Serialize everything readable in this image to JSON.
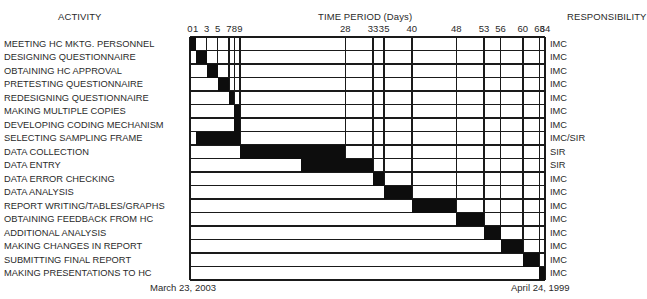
{
  "chart_data": {
    "type": "gantt",
    "title": "TIME PERIOD (Days)",
    "column_headers": {
      "activity": "ACTIVITY",
      "time": "TIME PERIOD (Days)",
      "responsibility": "RESPONSIBILITY"
    },
    "x_ticks": [
      0,
      1,
      3,
      5,
      7,
      8,
      9,
      28,
      33,
      35,
      40,
      48,
      53,
      56,
      60,
      63,
      64
    ],
    "x_range": [
      0,
      64
    ],
    "start_date": "March 23, 2003",
    "end_date": "April 24, 1999",
    "tasks": [
      {
        "activity": "MEETING HC MKTG. PERSONNEL",
        "start": 0,
        "end": 1,
        "responsibility": "IMC"
      },
      {
        "activity": "DESIGNING QUESTIONNAIRE",
        "start": 1,
        "end": 3,
        "responsibility": "IMC"
      },
      {
        "activity": "OBTAINING HC APPROVAL",
        "start": 3,
        "end": 5,
        "responsibility": "IMC"
      },
      {
        "activity": "PRETESTING QUESTIONNAIRE",
        "start": 5,
        "end": 7,
        "responsibility": "IMC"
      },
      {
        "activity": "REDESIGNING QUESTIONNAIRE",
        "start": 7,
        "end": 8,
        "responsibility": "IMC"
      },
      {
        "activity": "MAKING MULTIPLE COPIES",
        "start": 8,
        "end": 9,
        "responsibility": "IMC"
      },
      {
        "activity": "DEVELOPING CODING MECHANISM",
        "start": 8,
        "end": 9,
        "responsibility": "IMC"
      },
      {
        "activity": "SELECTING SAMPLING FRAME",
        "start": 1,
        "end": 9,
        "responsibility": "IMC/SIR"
      },
      {
        "activity": "DATA COLLECTION",
        "start": 9,
        "end": 28,
        "responsibility": "SIR"
      },
      {
        "activity": "DATA ENTRY",
        "start": 20,
        "end": 33,
        "responsibility": "SIR"
      },
      {
        "activity": "DATA ERROR CHECKING",
        "start": 33,
        "end": 35,
        "responsibility": "IMC"
      },
      {
        "activity": "DATA ANALYSIS",
        "start": 35,
        "end": 40,
        "responsibility": "IMC"
      },
      {
        "activity": "REPORT WRITING/TABLES/GRAPHS",
        "start": 40,
        "end": 48,
        "responsibility": "IMC"
      },
      {
        "activity": "OBTAINING FEEDBACK FROM HC",
        "start": 48,
        "end": 53,
        "responsibility": "IMC"
      },
      {
        "activity": "ADDITIONAL ANALYSIS",
        "start": 53,
        "end": 56,
        "responsibility": "IMC"
      },
      {
        "activity": "MAKING CHANGES IN REPORT",
        "start": 56,
        "end": 60,
        "responsibility": "IMC"
      },
      {
        "activity": "SUBMITTING FINAL REPORT",
        "start": 60,
        "end": 63,
        "responsibility": "IMC"
      },
      {
        "activity": "MAKING PRESENTATIONS TO HC",
        "start": 63,
        "end": 64,
        "responsibility": "IMC"
      }
    ]
  },
  "header": {
    "activity": "ACTIVITY",
    "time": "TIME PERIOD (Days)",
    "responsibility": "RESPONSIBILITY"
  },
  "footer": {
    "start_date": "March 23, 2003",
    "end_date": "April 24, 1999"
  },
  "colors": {
    "bar": "#0d0d0d",
    "grid": "#1a1a1a",
    "text": "#2a2a2a"
  }
}
